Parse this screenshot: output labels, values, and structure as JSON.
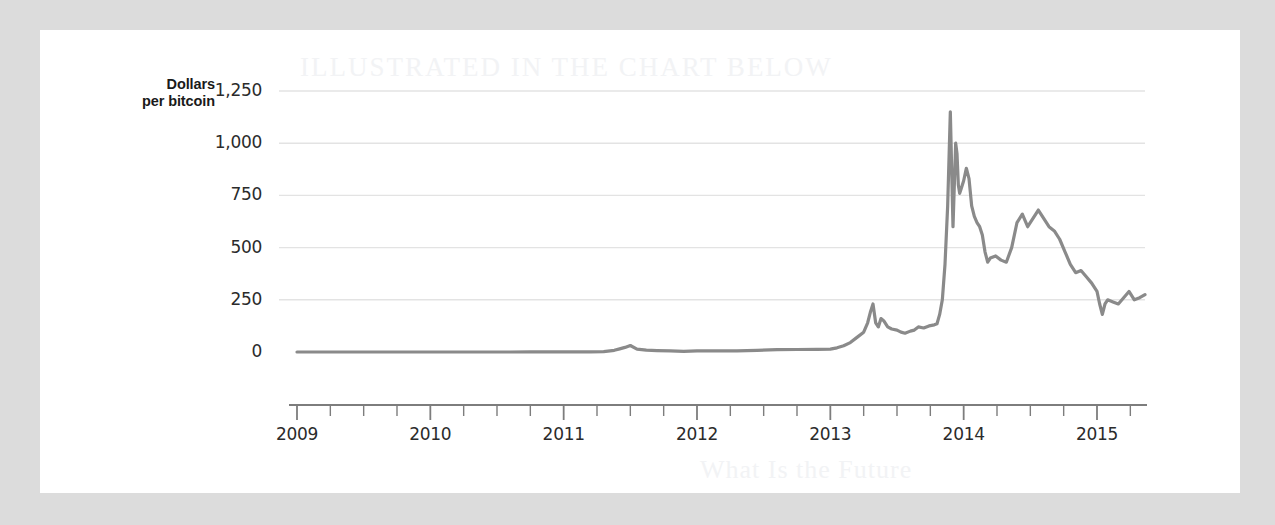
{
  "figure": {
    "paper_background": "#ffffff",
    "outer_background": "#dcdcdc",
    "line_color": "#8a8a8a",
    "grid_color": "#e3e3e3",
    "axis_color": "#7d7d7d",
    "ghost_top_text": "ILLUSTRATED  IN  THE  CHART  BELOW",
    "ghost_bottom_text": "What Is the Future"
  },
  "chart_data": {
    "type": "line",
    "title": "",
    "xlabel": "",
    "ylabel": "Dollars per bitcoin",
    "ylabel_line1": "Dollars",
    "ylabel_line2": "per bitcoin",
    "grid": "horizontal",
    "legend": "none",
    "xlim": [
      2009.0,
      2015.36
    ],
    "ylim": [
      0,
      1250
    ],
    "yticks": [
      0,
      250,
      500,
      750,
      1000,
      1250
    ],
    "ytick_labels": [
      "0",
      "250",
      "500",
      "750",
      "1,000",
      "1,250"
    ],
    "xticks": [
      2009,
      2010,
      2011,
      2012,
      2013,
      2014,
      2015
    ],
    "xtick_labels": [
      "2009",
      "2010",
      "2011",
      "2012",
      "2013",
      "2014",
      "2015"
    ],
    "minor_xtick_interval": 0.25,
    "series": [
      {
        "name": "Bitcoin price",
        "units": "USD per bitcoin",
        "x": [
          2009.0,
          2009.25,
          2009.5,
          2009.75,
          2010.0,
          2010.25,
          2010.5,
          2010.6,
          2010.75,
          2010.9,
          2011.0,
          2011.1,
          2011.2,
          2011.3,
          2011.38,
          2011.42,
          2011.46,
          2011.5,
          2011.55,
          2011.62,
          2011.7,
          2011.8,
          2011.9,
          2012.0,
          2012.15,
          2012.3,
          2012.45,
          2012.6,
          2012.75,
          2012.9,
          2013.0,
          2013.05,
          2013.1,
          2013.15,
          2013.2,
          2013.25,
          2013.28,
          2013.3,
          2013.32,
          2013.34,
          2013.36,
          2013.38,
          2013.4,
          2013.43,
          2013.46,
          2013.5,
          2013.53,
          2013.56,
          2013.6,
          2013.63,
          2013.66,
          2013.7,
          2013.74,
          2013.78,
          2013.8,
          2013.82,
          2013.84,
          2013.86,
          2013.88,
          2013.9,
          2013.92,
          2013.94,
          2013.95,
          2013.96,
          2013.97,
          2013.98,
          2014.0,
          2014.02,
          2014.04,
          2014.06,
          2014.08,
          2014.1,
          2014.12,
          2014.14,
          2014.16,
          2014.18,
          2014.2,
          2014.24,
          2014.28,
          2014.32,
          2014.36,
          2014.4,
          2014.44,
          2014.48,
          2014.52,
          2014.56,
          2014.6,
          2014.64,
          2014.68,
          2014.72,
          2014.76,
          2014.8,
          2014.84,
          2014.88,
          2014.92,
          2014.96,
          2015.0,
          2015.02,
          2015.04,
          2015.06,
          2015.08,
          2015.12,
          2015.16,
          2015.2,
          2015.24,
          2015.28,
          2015.32,
          2015.36
        ],
        "y": [
          0,
          0,
          0,
          0,
          0,
          0,
          0.06,
          0.07,
          0.2,
          0.3,
          0.3,
          0.9,
          1.0,
          2.0,
          8.0,
          15.0,
          22.0,
          31.0,
          14.0,
          9.0,
          7.0,
          5.0,
          3.0,
          5.0,
          5.0,
          5.5,
          8.0,
          11.0,
          12.0,
          13.0,
          13.5,
          20.0,
          30.0,
          45.0,
          70.0,
          95.0,
          140.0,
          190.0,
          230.0,
          140.0,
          120.0,
          160.0,
          150.0,
          120.0,
          110.0,
          105.0,
          95.0,
          90.0,
          100.0,
          105.0,
          120.0,
          115.0,
          125.0,
          130.0,
          135.0,
          180.0,
          250.0,
          420.0,
          700.0,
          1150.0,
          600.0,
          1000.0,
          950.0,
          800.0,
          760.0,
          780.0,
          820.0,
          880.0,
          830.0,
          700.0,
          650.0,
          620.0,
          600.0,
          560.0,
          480.0,
          430.0,
          450.0,
          460.0,
          440.0,
          430.0,
          500.0,
          620.0,
          660.0,
          600.0,
          640.0,
          680.0,
          640.0,
          600.0,
          580.0,
          540.0,
          480.0,
          420.0,
          380.0,
          390.0,
          360.0,
          330.0,
          290.0,
          230.0,
          180.0,
          230.0,
          250.0,
          240.0,
          230.0,
          260.0,
          290.0,
          250.0,
          260.0,
          275.0
        ]
      }
    ],
    "annotations": [
      {
        "label": "2011 bubble peak",
        "x": 2011.5,
        "y": 31
      },
      {
        "label": "spring 2013 spike",
        "x": 2013.32,
        "y": 230
      },
      {
        "label": "all-time high",
        "x": 2013.9,
        "y": 1150
      }
    ]
  }
}
